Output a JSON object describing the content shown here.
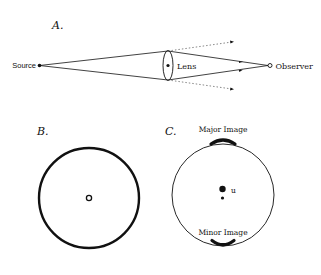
{
  "panel_a": {
    "label": "A.",
    "source_label": "Source",
    "lens_label": "Lens",
    "observer_label": "Observer"
  },
  "panel_b": {
    "label": "B."
  },
  "panel_c": {
    "label": "C.",
    "major_image_label": "Major Image",
    "minor_image_label": "Minor Image",
    "u_label": "u"
  },
  "colors": {
    "stroke": "#111111",
    "dotted": "#555555",
    "background": "#ffffff"
  }
}
